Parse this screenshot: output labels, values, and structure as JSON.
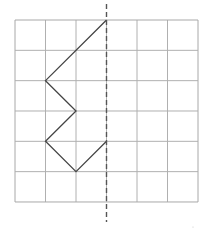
{
  "diagram": {
    "type": "grid-symmetry-figure",
    "grid": {
      "columns": 6,
      "rows": 6,
      "origin_px": [
        15,
        20
      ],
      "cell_px": [
        30.5,
        30.33
      ],
      "line_color": "#b0b0b0",
      "border_color": "#a8a8a8"
    },
    "axis_of_symmetry": {
      "style": "dashed",
      "grid_x": 3,
      "y_start_px": 4,
      "y_end_px": 222,
      "color": "#555555"
    },
    "figure": {
      "color": "#444444",
      "vertices_grid": [
        [
          3,
          0
        ],
        [
          1,
          2
        ],
        [
          2,
          3
        ],
        [
          1,
          4
        ],
        [
          2,
          5
        ],
        [
          3,
          4
        ]
      ]
    }
  }
}
